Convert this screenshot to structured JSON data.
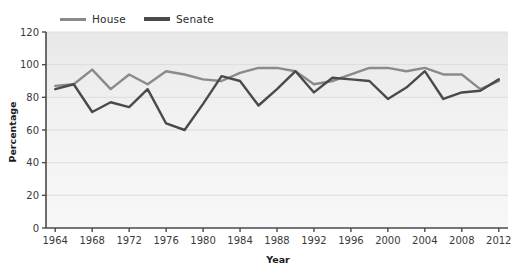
{
  "legend": {
    "position": "top-left",
    "entries": [
      {
        "label": "House",
        "color": "#8a8a8a",
        "name": "legend-house"
      },
      {
        "label": "Senate",
        "color": "#4a4a4a",
        "name": "legend-senate"
      }
    ]
  },
  "colors": {
    "plot_background": "#efefef",
    "panel_background": "#f4f4f4",
    "gridline": "#dcdcdc",
    "axis": "#4a4a4a",
    "text": "#2b2b2b",
    "house": "#8a8a8a",
    "senate": "#4a4a4a"
  },
  "chart_data": {
    "type": "line",
    "title": "",
    "subtitle": "",
    "xlabel": "Year",
    "ylabel": "Percentage",
    "xlim": [
      1963,
      2013
    ],
    "ylim": [
      0,
      120
    ],
    "ytick_step": 20,
    "yticks": [
      0,
      20,
      40,
      60,
      80,
      100,
      120
    ],
    "xticks": [
      1964,
      1968,
      1972,
      1976,
      1980,
      1984,
      1988,
      1992,
      1996,
      2000,
      2004,
      2008,
      2012
    ],
    "x": [
      1964,
      1966,
      1968,
      1970,
      1972,
      1974,
      1976,
      1978,
      1980,
      1982,
      1984,
      1986,
      1988,
      1990,
      1992,
      1994,
      1996,
      1998,
      2000,
      2002,
      2004,
      2006,
      2008,
      2010,
      2012
    ],
    "grid": true,
    "grid_axis": "y",
    "legend_position": "top-left",
    "series": [
      {
        "name": "House",
        "color": "#8a8a8a",
        "values": [
          87,
          88,
          97,
          85,
          94,
          88,
          96,
          94,
          91,
          90,
          95,
          98,
          98,
          96,
          88,
          90,
          94,
          98,
          98,
          96,
          98,
          94,
          94,
          85,
          90
        ]
      },
      {
        "name": "Senate",
        "color": "#4a4a4a",
        "values": [
          85,
          88,
          71,
          77,
          74,
          85,
          64,
          60,
          76,
          93,
          90,
          75,
          85,
          96,
          83,
          92,
          91,
          90,
          79,
          86,
          96,
          79,
          83,
          84,
          91
        ]
      }
    ]
  }
}
